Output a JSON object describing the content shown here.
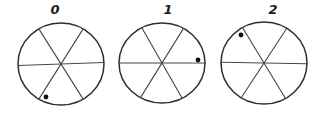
{
  "figure": {
    "background_color": "#ffffff",
    "outline_color": "#2e2e2e",
    "line_color": "#474747",
    "dot_color": "#101010",
    "sectors_per_wheel": 6,
    "wheels": [
      {
        "label": "0",
        "cx": 61,
        "cy": 64,
        "rx": 43,
        "ry": 41,
        "line_angles_deg": [
          2,
          59,
          121
        ],
        "dot": {
          "dx": -15,
          "dy": 33,
          "angle_deg": 245,
          "sector": "bottom-near-lower-left-line"
        }
      },
      {
        "label": "1",
        "cx": 162,
        "cy": 63,
        "rx": 43,
        "ry": 40,
        "line_angles_deg": [
          0,
          60,
          118
        ],
        "dot": {
          "dx": 36,
          "dy": -3,
          "angle_deg": 5,
          "sector": "upper-right-near-horizontal-line"
        }
      },
      {
        "label": "2",
        "cx": 264,
        "cy": 63,
        "rx": 43,
        "ry": 41,
        "line_angles_deg": [
          -1,
          58,
          120
        ],
        "dot": {
          "dx": -23,
          "dy": -28,
          "angle_deg": 130,
          "sector": "upper-left"
        }
      }
    ],
    "label_positions": [
      {
        "x": 55,
        "y": 14
      },
      {
        "x": 168,
        "y": 14
      },
      {
        "x": 273,
        "y": 14
      }
    ],
    "dot_radius": 2.4,
    "outline_width": 1.5,
    "line_width": 1.1
  }
}
